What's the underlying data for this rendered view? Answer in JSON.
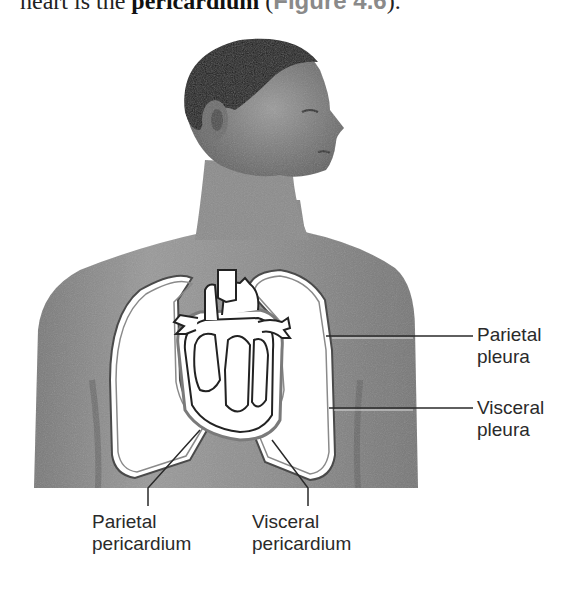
{
  "text_above": {
    "prefix": "heart is the ",
    "term": "pericardium",
    "open_paren": " (",
    "figure_ref": "Figure 4.6",
    "close": ")."
  },
  "figure": {
    "labels": {
      "parietal_pleura": {
        "line1": "Parietal",
        "line2": "pleura"
      },
      "visceral_pleura": {
        "line1": "Visceral",
        "line2": "pleura"
      },
      "parietal_pericardium": {
        "line1": "Parietal",
        "line2": "pericardium"
      },
      "visceral_pericardium": {
        "line1": "Visceral",
        "line2": "pericardium"
      }
    }
  }
}
